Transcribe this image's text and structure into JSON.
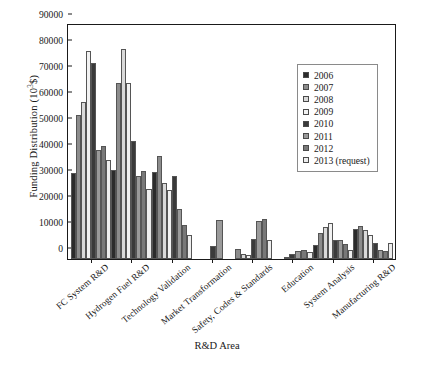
{
  "chart_data": {
    "type": "bar",
    "title": "",
    "xlabel": "R&D Area",
    "ylabel": "Funding Distribution (10³$)",
    "ylabel_main": "Funding Distribution (10",
    "ylabel_sup": "3",
    "ylabel_tail": "$)",
    "ylim": [
      0,
      90000
    ],
    "yticks": [
      0,
      10000,
      20000,
      30000,
      40000,
      50000,
      60000,
      70000,
      80000,
      90000
    ],
    "ytick_labels": [
      "0",
      "10000",
      "20000",
      "30000",
      "40000",
      "50000",
      "60000",
      "70000",
      "80000",
      "90000"
    ],
    "grid": false,
    "legend_position": "upper right",
    "categories": [
      "FC System R&D",
      "Hydrogen Fuel R&D",
      "Technology Validation",
      "Market Transformation",
      "Safety, Codes & Standards",
      "Education",
      "System Analysis",
      "Manufacturing R&D"
    ],
    "series": [
      {
        "name": "2006",
        "color": "#2b2b2b",
        "values": [
          33200,
          34300,
          33400,
          0,
          0,
          0,
          5200,
          11500
        ]
      },
      {
        "name": "2007",
        "color": "#8c8c8c",
        "values": [
          55500,
          67600,
          39500,
          0,
          3900,
          0,
          10100,
          12800
        ]
      },
      {
        "name": "2008",
        "color": "#d9d9d9",
        "values": [
          60400,
          80800,
          29400,
          0,
          2000,
          0,
          12400,
          11100
        ]
      },
      {
        "name": "2009",
        "color": "#f2f2f2",
        "values": [
          79900,
          67800,
          26500,
          0,
          1600,
          700,
          13900,
          9400
        ]
      },
      {
        "name": "2010",
        "color": "#3a3a3a",
        "values": [
          75500,
          45500,
          32000,
          5000,
          7700,
          2000,
          7500,
          6000
        ]
      },
      {
        "name": "2011",
        "color": "#9a9a9a",
        "values": [
          41900,
          32000,
          19300,
          15000,
          14800,
          3200,
          7400,
          3500
        ]
      },
      {
        "name": "2012",
        "color": "#787878",
        "values": [
          43400,
          33800,
          13200,
          0,
          15200,
          3600,
          5700,
          3000
        ]
      },
      {
        "name": "2013 (request)",
        "color": "#ededed",
        "values": [
          38000,
          26800,
          9300,
          0,
          7400,
          2800,
          3400,
          6000
        ]
      }
    ]
  }
}
